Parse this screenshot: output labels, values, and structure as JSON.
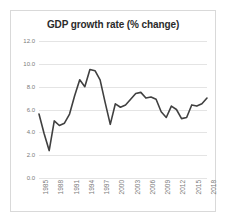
{
  "chart_data": {
    "type": "line",
    "title": "GDP growth rate (% change)",
    "xlabel": "",
    "ylabel": "",
    "ylim": [
      0.0,
      12.0
    ],
    "yticks": [
      "0.0",
      "2.0",
      "4.0",
      "6.0",
      "8.0",
      "10.0",
      "12.0"
    ],
    "ytick_values": [
      0.0,
      2.0,
      4.0,
      6.0,
      8.0,
      10.0,
      12.0
    ],
    "grid": true,
    "legend": "none",
    "xticks": [
      "1985",
      "1988",
      "1991",
      "1994",
      "1997",
      "2000",
      "2003",
      "2006",
      "2009",
      "2012",
      "2015",
      "2018"
    ],
    "xtick_step": 3,
    "xlim": [
      1985,
      2018
    ],
    "line_color": "#404040",
    "x": [
      1985,
      1986,
      1987,
      1988,
      1989,
      1990,
      1991,
      1992,
      1993,
      1994,
      1995,
      1996,
      1997,
      1998,
      1999,
      2000,
      2001,
      2002,
      2003,
      2004,
      2005,
      2006,
      2007,
      2008,
      2009,
      2010,
      2011,
      2012,
      2013,
      2014,
      2015,
      2016,
      2017,
      2018
    ],
    "values": [
      5.6,
      3.9,
      2.4,
      5.0,
      4.6,
      4.8,
      5.6,
      7.2,
      8.6,
      8.0,
      9.5,
      9.4,
      8.6,
      6.6,
      4.7,
      6.5,
      6.2,
      6.4,
      6.9,
      7.4,
      7.5,
      7.0,
      7.1,
      6.9,
      5.8,
      5.3,
      6.3,
      6.0,
      5.2,
      5.3,
      6.4,
      6.3,
      6.5,
      7.0
    ],
    "series": [
      {
        "name": "GDP growth rate",
        "values": [
          5.6,
          3.9,
          2.4,
          5.0,
          4.6,
          4.8,
          5.6,
          7.2,
          8.6,
          8.0,
          9.5,
          9.4,
          8.6,
          6.6,
          4.7,
          6.5,
          6.2,
          6.4,
          6.9,
          7.4,
          7.5,
          7.0,
          7.1,
          6.9,
          5.8,
          5.3,
          6.3,
          6.0,
          5.2,
          5.3,
          6.4,
          6.3,
          6.5,
          7.0
        ]
      }
    ]
  }
}
